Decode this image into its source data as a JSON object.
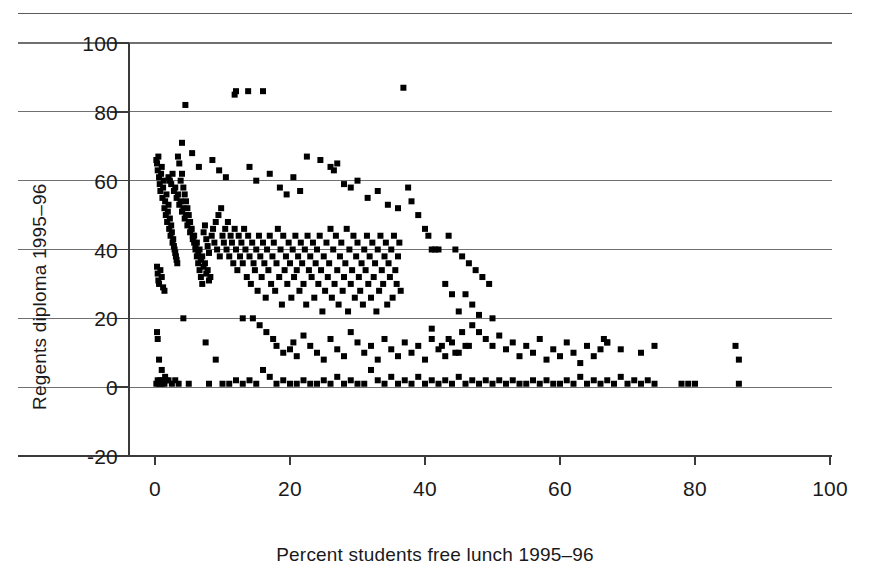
{
  "figure": {
    "top_rule": true
  },
  "chart_data": {
    "type": "scatter",
    "title": "",
    "xlabel": "Percent students free lunch 1995–96",
    "ylabel": "Regents diploma 1995–96",
    "xlim": [
      -5,
      100
    ],
    "ylim": [
      -20,
      100
    ],
    "xticks": [
      0,
      20,
      40,
      60,
      80,
      100
    ],
    "xtick_labels": [
      "0",
      "20",
      "40",
      "60",
      "80",
      "100"
    ],
    "yticks": [
      -20,
      0,
      20,
      40,
      60,
      80,
      100
    ],
    "ytick_labels": [
      "-20",
      "0",
      "20",
      "40",
      "60",
      "80",
      "100"
    ],
    "grid": "horizontal",
    "legend": "none",
    "marker": "square",
    "marker_color": "#000000",
    "marker_size_px": 6,
    "n_points": 616,
    "points": [
      [
        0.2,
        66
      ],
      [
        0.3,
        65
      ],
      [
        0.4,
        63
      ],
      [
        0.5,
        67
      ],
      [
        0.6,
        61
      ],
      [
        0.7,
        59
      ],
      [
        0.8,
        57
      ],
      [
        0.9,
        62
      ],
      [
        1.0,
        64
      ],
      [
        1.1,
        55
      ],
      [
        1.2,
        58
      ],
      [
        1.3,
        60
      ],
      [
        1.4,
        52
      ],
      [
        1.5,
        54
      ],
      [
        1.6,
        50
      ],
      [
        1.7,
        56
      ],
      [
        1.8,
        48
      ],
      [
        1.9,
        51
      ],
      [
        2.0,
        53
      ],
      [
        2.1,
        46
      ],
      [
        2.2,
        49
      ],
      [
        2.3,
        44
      ],
      [
        2.4,
        47
      ],
      [
        2.5,
        45
      ],
      [
        2.6,
        42
      ],
      [
        2.7,
        43
      ],
      [
        2.8,
        41
      ],
      [
        2.9,
        40
      ],
      [
        3.0,
        39
      ],
      [
        3.1,
        38
      ],
      [
        3.2,
        37
      ],
      [
        3.3,
        36
      ],
      [
        0.3,
        35
      ],
      [
        0.4,
        33
      ],
      [
        0.5,
        31
      ],
      [
        0.6,
        30
      ],
      [
        0.8,
        34
      ],
      [
        1.0,
        32
      ],
      [
        1.2,
        29
      ],
      [
        1.4,
        28
      ],
      [
        0.2,
        1
      ],
      [
        0.4,
        2
      ],
      [
        0.6,
        1
      ],
      [
        0.8,
        2
      ],
      [
        1.0,
        1
      ],
      [
        1.2,
        2
      ],
      [
        1.4,
        1
      ],
      [
        1.6,
        2
      ],
      [
        0.3,
        16
      ],
      [
        0.4,
        14
      ],
      [
        0.6,
        8
      ],
      [
        1.0,
        5
      ],
      [
        1.5,
        3
      ],
      [
        2.0,
        2
      ],
      [
        2.5,
        1
      ],
      [
        3.0,
        2
      ],
      [
        3.4,
        67
      ],
      [
        3.6,
        65
      ],
      [
        3.8,
        60
      ],
      [
        4.0,
        62
      ],
      [
        4.2,
        58
      ],
      [
        4.4,
        56
      ],
      [
        4.6,
        54
      ],
      [
        4.8,
        52
      ],
      [
        5.0,
        50
      ],
      [
        5.2,
        48
      ],
      [
        5.4,
        46
      ],
      [
        5.6,
        44
      ],
      [
        5.8,
        42
      ],
      [
        6.0,
        40
      ],
      [
        6.2,
        38
      ],
      [
        6.4,
        36
      ],
      [
        6.6,
        34
      ],
      [
        6.8,
        32
      ],
      [
        7.0,
        30
      ],
      [
        7.2,
        45
      ],
      [
        7.4,
        47
      ],
      [
        7.6,
        43
      ],
      [
        7.8,
        41
      ],
      [
        8.0,
        39
      ],
      [
        4.5,
        82
      ],
      [
        11.8,
        85
      ],
      [
        12.0,
        86
      ],
      [
        13.8,
        86
      ],
      [
        16.0,
        86
      ],
      [
        36.8,
        87
      ],
      [
        4.0,
        71
      ],
      [
        5.5,
        68
      ],
      [
        6.5,
        64
      ],
      [
        8.5,
        66
      ],
      [
        9.5,
        63
      ],
      [
        10.5,
        61
      ],
      [
        2.0,
        61
      ],
      [
        2.2,
        60
      ],
      [
        2.4,
        59
      ],
      [
        2.6,
        62
      ],
      [
        2.8,
        57
      ],
      [
        3.0,
        58
      ],
      [
        3.2,
        55
      ],
      [
        3.4,
        56
      ],
      [
        3.6,
        53
      ],
      [
        3.8,
        54
      ],
      [
        4.0,
        51
      ],
      [
        4.2,
        52
      ],
      [
        4.4,
        49
      ],
      [
        4.6,
        50
      ],
      [
        4.8,
        47
      ],
      [
        5.0,
        48
      ],
      [
        5.2,
        45
      ],
      [
        5.4,
        46
      ],
      [
        5.6,
        43
      ],
      [
        5.8,
        44
      ],
      [
        6.0,
        41
      ],
      [
        6.2,
        42
      ],
      [
        6.4,
        39
      ],
      [
        6.6,
        40
      ],
      [
        6.8,
        37
      ],
      [
        7.0,
        38
      ],
      [
        7.2,
        35
      ],
      [
        7.4,
        36
      ],
      [
        7.6,
        33
      ],
      [
        7.8,
        34
      ],
      [
        8.0,
        31
      ],
      [
        8.2,
        32
      ],
      [
        8.4,
        44
      ],
      [
        8.6,
        46
      ],
      [
        8.8,
        42
      ],
      [
        9.0,
        48
      ],
      [
        9.2,
        40
      ],
      [
        9.4,
        50
      ],
      [
        9.6,
        38
      ],
      [
        9.8,
        52
      ],
      [
        10.0,
        44
      ],
      [
        10.2,
        42
      ],
      [
        10.4,
        46
      ],
      [
        10.6,
        40
      ],
      [
        10.8,
        48
      ],
      [
        11.0,
        38
      ],
      [
        11.2,
        44
      ],
      [
        11.4,
        42
      ],
      [
        11.6,
        36
      ],
      [
        11.8,
        46
      ],
      [
        12.0,
        40
      ],
      [
        12.2,
        34
      ],
      [
        12.4,
        44
      ],
      [
        12.6,
        38
      ],
      [
        12.8,
        42
      ],
      [
        13.0,
        36
      ],
      [
        13.2,
        46
      ],
      [
        13.4,
        40
      ],
      [
        13.6,
        32
      ],
      [
        13.8,
        44
      ],
      [
        14.0,
        38
      ],
      [
        14.2,
        30
      ],
      [
        14.4,
        42
      ],
      [
        14.6,
        36
      ],
      [
        14.8,
        34
      ],
      [
        15.0,
        40
      ],
      [
        15.2,
        28
      ],
      [
        15.4,
        44
      ],
      [
        15.6,
        38
      ],
      [
        15.8,
        32
      ],
      [
        16.0,
        42
      ],
      [
        16.2,
        36
      ],
      [
        16.4,
        26
      ],
      [
        16.6,
        40
      ],
      [
        16.8,
        34
      ],
      [
        17.0,
        44
      ],
      [
        17.2,
        30
      ],
      [
        17.4,
        38
      ],
      [
        17.6,
        42
      ],
      [
        17.8,
        28
      ],
      [
        18.0,
        36
      ],
      [
        18.2,
        46
      ],
      [
        18.4,
        32
      ],
      [
        18.6,
        40
      ],
      [
        18.8,
        24
      ],
      [
        19.0,
        44
      ],
      [
        19.2,
        34
      ],
      [
        19.4,
        38
      ],
      [
        19.6,
        30
      ],
      [
        19.8,
        42
      ],
      [
        20.0,
        36
      ],
      [
        20.2,
        26
      ],
      [
        20.4,
        40
      ],
      [
        20.6,
        32
      ],
      [
        20.8,
        44
      ],
      [
        21.0,
        34
      ],
      [
        21.2,
        38
      ],
      [
        21.4,
        28
      ],
      [
        21.6,
        42
      ],
      [
        21.8,
        36
      ],
      [
        22.0,
        30
      ],
      [
        22.2,
        40
      ],
      [
        22.4,
        24
      ],
      [
        22.6,
        44
      ],
      [
        22.8,
        34
      ],
      [
        23.0,
        38
      ],
      [
        23.2,
        32
      ],
      [
        23.4,
        42
      ],
      [
        23.6,
        26
      ],
      [
        23.8,
        36
      ],
      [
        24.0,
        40
      ],
      [
        24.2,
        30
      ],
      [
        24.4,
        44
      ],
      [
        24.6,
        34
      ],
      [
        24.8,
        22
      ],
      [
        25.0,
        38
      ],
      [
        25.2,
        28
      ],
      [
        25.4,
        42
      ],
      [
        25.6,
        32
      ],
      [
        25.8,
        36
      ],
      [
        26.0,
        46
      ],
      [
        26.2,
        26
      ],
      [
        26.4,
        40
      ],
      [
        26.6,
        30
      ],
      [
        26.8,
        44
      ],
      [
        27.0,
        34
      ],
      [
        27.2,
        24
      ],
      [
        27.4,
        38
      ],
      [
        27.6,
        42
      ],
      [
        27.8,
        28
      ],
      [
        28.0,
        32
      ],
      [
        28.2,
        36
      ],
      [
        28.4,
        46
      ],
      [
        28.6,
        22
      ],
      [
        28.8,
        40
      ],
      [
        29.0,
        30
      ],
      [
        29.2,
        34
      ],
      [
        29.4,
        44
      ],
      [
        29.6,
        26
      ],
      [
        29.8,
        38
      ],
      [
        30.0,
        42
      ],
      [
        30.2,
        32
      ],
      [
        30.4,
        28
      ],
      [
        30.6,
        36
      ],
      [
        30.8,
        24
      ],
      [
        31.0,
        40
      ],
      [
        31.2,
        34
      ],
      [
        31.4,
        44
      ],
      [
        31.6,
        30
      ],
      [
        31.8,
        38
      ],
      [
        32.0,
        26
      ],
      [
        32.2,
        42
      ],
      [
        32.4,
        32
      ],
      [
        32.6,
        36
      ],
      [
        32.8,
        22
      ],
      [
        33.0,
        40
      ],
      [
        33.2,
        28
      ],
      [
        33.4,
        44
      ],
      [
        33.6,
        34
      ],
      [
        33.8,
        30
      ],
      [
        34.0,
        38
      ],
      [
        34.2,
        42
      ],
      [
        34.4,
        24
      ],
      [
        34.6,
        36
      ],
      [
        34.8,
        32
      ],
      [
        35.0,
        40
      ],
      [
        35.2,
        26
      ],
      [
        35.4,
        44
      ],
      [
        35.6,
        34
      ],
      [
        35.8,
        30
      ],
      [
        36.0,
        38
      ],
      [
        36.2,
        42
      ],
      [
        36.4,
        28
      ],
      [
        22.5,
        67
      ],
      [
        24.5,
        66
      ],
      [
        26.0,
        64
      ],
      [
        26.5,
        63
      ],
      [
        27.0,
        65
      ],
      [
        28.0,
        59
      ],
      [
        29.0,
        58
      ],
      [
        14.0,
        64
      ],
      [
        15.0,
        60
      ],
      [
        17.0,
        62
      ],
      [
        18.5,
        58
      ],
      [
        19.5,
        56
      ],
      [
        20.5,
        61
      ],
      [
        21.5,
        57
      ],
      [
        30.0,
        60
      ],
      [
        31.5,
        55
      ],
      [
        33.0,
        57
      ],
      [
        34.5,
        53
      ],
      [
        36.0,
        52
      ],
      [
        37.5,
        58
      ],
      [
        38.0,
        54
      ],
      [
        39.0,
        50
      ],
      [
        40.0,
        46
      ],
      [
        40.5,
        44
      ],
      [
        41.0,
        40
      ],
      [
        41.5,
        40
      ],
      [
        42.0,
        40
      ],
      [
        13.0,
        20
      ],
      [
        14.5,
        20
      ],
      [
        15.5,
        18
      ],
      [
        16.5,
        16
      ],
      [
        17.5,
        14
      ],
      [
        18.0,
        12
      ],
      [
        19.0,
        10
      ],
      [
        20.0,
        11
      ],
      [
        20.5,
        13
      ],
      [
        21.0,
        9
      ],
      [
        22.0,
        15
      ],
      [
        23.0,
        12
      ],
      [
        24.0,
        10
      ],
      [
        25.0,
        8
      ],
      [
        26.0,
        14
      ],
      [
        27.0,
        11
      ],
      [
        28.0,
        9
      ],
      [
        29.0,
        16
      ],
      [
        30.0,
        13
      ],
      [
        31.0,
        10
      ],
      [
        32.0,
        12
      ],
      [
        33.0,
        8
      ],
      [
        34.0,
        14
      ],
      [
        35.0,
        11
      ],
      [
        36.0,
        9
      ],
      [
        37.0,
        13
      ],
      [
        38.0,
        10
      ],
      [
        39.0,
        12
      ],
      [
        40.0,
        8
      ],
      [
        41.0,
        14
      ],
      [
        42.0,
        11
      ],
      [
        43.0,
        9
      ],
      [
        44.0,
        13
      ],
      [
        45.0,
        10
      ],
      [
        46.0,
        12
      ],
      [
        4.2,
        20
      ],
      [
        7.5,
        13
      ],
      [
        9.0,
        8
      ],
      [
        3.5,
        1
      ],
      [
        5.0,
        1
      ],
      [
        8.0,
        1
      ],
      [
        10.0,
        1
      ],
      [
        11.0,
        1
      ],
      [
        12.0,
        2
      ],
      [
        13.0,
        1
      ],
      [
        14.0,
        2
      ],
      [
        15.0,
        1
      ],
      [
        16.0,
        5
      ],
      [
        17.0,
        3
      ],
      [
        18.0,
        1
      ],
      [
        19.0,
        2
      ],
      [
        20.0,
        1
      ],
      [
        21.0,
        1
      ],
      [
        22.0,
        2
      ],
      [
        23.0,
        1
      ],
      [
        24.0,
        1
      ],
      [
        25.0,
        2
      ],
      [
        26.0,
        1
      ],
      [
        27.0,
        3
      ],
      [
        28.0,
        1
      ],
      [
        29.0,
        2
      ],
      [
        30.0,
        1
      ],
      [
        31.0,
        1
      ],
      [
        32.0,
        5
      ],
      [
        33.0,
        2
      ],
      [
        34.0,
        1
      ],
      [
        35.0,
        3
      ],
      [
        36.0,
        1
      ],
      [
        37.0,
        2
      ],
      [
        38.0,
        1
      ],
      [
        39.0,
        3
      ],
      [
        40.0,
        1
      ],
      [
        41.0,
        2
      ],
      [
        42.0,
        1
      ],
      [
        43.0,
        2
      ],
      [
        44.0,
        1
      ],
      [
        45.0,
        3
      ],
      [
        46.0,
        1
      ],
      [
        47.0,
        2
      ],
      [
        48.0,
        1
      ],
      [
        49.0,
        2
      ],
      [
        50.0,
        1
      ],
      [
        43.0,
        30
      ],
      [
        44.0,
        27
      ],
      [
        45.0,
        22
      ],
      [
        46.0,
        27
      ],
      [
        47.0,
        24
      ],
      [
        48.0,
        21
      ],
      [
        50.0,
        20
      ],
      [
        43.5,
        44
      ],
      [
        44.5,
        40
      ],
      [
        45.5,
        38
      ],
      [
        46.5,
        36
      ],
      [
        47.5,
        34
      ],
      [
        48.5,
        32
      ],
      [
        49.5,
        30
      ],
      [
        47.0,
        18
      ],
      [
        48.0,
        16
      ],
      [
        49.0,
        14
      ],
      [
        50.0,
        12
      ],
      [
        51.0,
        15
      ],
      [
        52.0,
        11
      ],
      [
        53.0,
        13
      ],
      [
        54.0,
        9
      ],
      [
        55.0,
        12
      ],
      [
        56.0,
        10
      ],
      [
        57.0,
        14
      ],
      [
        58.0,
        8
      ],
      [
        59.0,
        11
      ],
      [
        60.0,
        9
      ],
      [
        61.0,
        13
      ],
      [
        62.0,
        10
      ],
      [
        63.0,
        7
      ],
      [
        64.0,
        12
      ],
      [
        65.0,
        9
      ],
      [
        66.0,
        11
      ],
      [
        67.0,
        13
      ],
      [
        51.0,
        2
      ],
      [
        52.0,
        1
      ],
      [
        53.0,
        2
      ],
      [
        54.0,
        1
      ],
      [
        55.0,
        1
      ],
      [
        56.0,
        2
      ],
      [
        57.0,
        1
      ],
      [
        58.0,
        2
      ],
      [
        59.0,
        1
      ],
      [
        60.0,
        1
      ],
      [
        61.0,
        2
      ],
      [
        62.0,
        1
      ],
      [
        63.0,
        3
      ],
      [
        64.0,
        1
      ],
      [
        65.0,
        2
      ],
      [
        66.0,
        1
      ],
      [
        67.0,
        2
      ],
      [
        68.0,
        1
      ],
      [
        69.0,
        3
      ],
      [
        70.0,
        1
      ],
      [
        71.0,
        2
      ],
      [
        72.0,
        1
      ],
      [
        73.0,
        2
      ],
      [
        74.0,
        1
      ],
      [
        66.5,
        14
      ],
      [
        67.0,
        13
      ],
      [
        69.0,
        11
      ],
      [
        72.0,
        10
      ],
      [
        74.0,
        12
      ],
      [
        78.0,
        1
      ],
      [
        79.0,
        1
      ],
      [
        80.0,
        1
      ],
      [
        86.0,
        12
      ],
      [
        86.5,
        8
      ],
      [
        86.5,
        1
      ],
      [
        41.0,
        17
      ],
      [
        42.5,
        12
      ],
      [
        43.5,
        14
      ],
      [
        44.5,
        10
      ],
      [
        45.5,
        16
      ],
      [
        46.5,
        12
      ]
    ]
  },
  "axes": {
    "y_title": "Regents diploma 1995–96",
    "x_title": "Percent students free lunch 1995–96",
    "y_labels": [
      "100",
      "80",
      "60",
      "40",
      "20",
      "0",
      "-20"
    ],
    "x_labels": [
      "0",
      "20",
      "40",
      "60",
      "80",
      "100"
    ]
  }
}
